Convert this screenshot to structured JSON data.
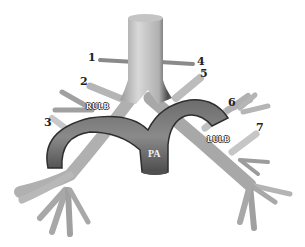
{
  "figure": {
    "colors": {
      "airway_light": "#d6d6d6",
      "airway_mid": "#a8a8a8",
      "airway_dark": "#5a5a5a",
      "artery_fill": "#7d7d7d",
      "artery_dark": "#3c3c3c",
      "background": "#ffffff"
    },
    "labels": {
      "numbers": [
        "1",
        "2",
        "3",
        "4",
        "5",
        "6",
        "7"
      ],
      "rulb": "RULB",
      "lulb": "LULB",
      "pa": "PA"
    }
  }
}
